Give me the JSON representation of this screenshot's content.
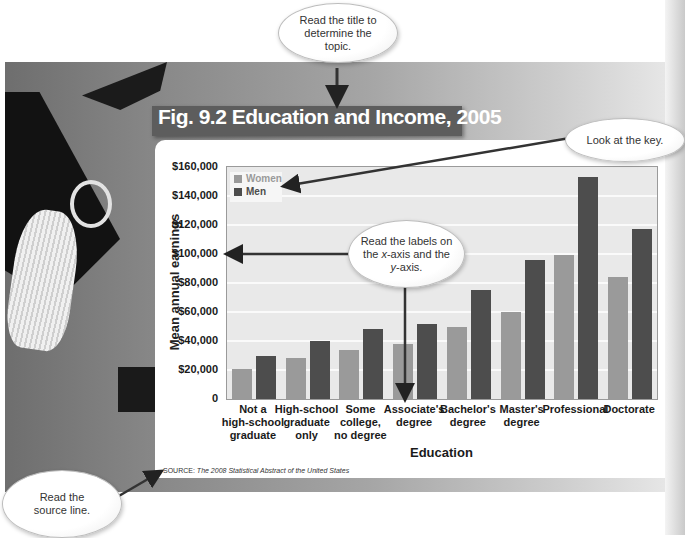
{
  "figure": {
    "title": "Fig. 9.2 Education and Income, 2005",
    "source_prefix": "SOURCE:",
    "source_text": "The 2008 Statistical Abstract of the United States"
  },
  "callouts": {
    "title": "Read the title to determine the topic.",
    "key": "Look at the key.",
    "axes_prefix": "Read the labels on the ",
    "axes_x": "x",
    "axes_mid": "-axis and the ",
    "axes_y": "y",
    "axes_suffix": "-axis.",
    "source": "Read the source line."
  },
  "colors": {
    "women": "#9a9a9a",
    "men": "#4d4d4d",
    "title_bar": "#5d5d5d",
    "plot_bg": "#e9e9e9"
  },
  "chart_data": {
    "type": "bar",
    "title": "Fig. 9.2 Education and Income, 2005",
    "xlabel": "Education",
    "ylabel": "Mean annual earnings",
    "ylim": [
      0,
      160000
    ],
    "yticks": [
      "0",
      "$20,000",
      "$40,000",
      "$60,000",
      "$80,000",
      "$100,000",
      "$120,000",
      "$140,000",
      "$160,000"
    ],
    "ytick_values": [
      0,
      20000,
      40000,
      60000,
      80000,
      100000,
      120000,
      140000,
      160000
    ],
    "grid": true,
    "legend_position": "top-left inside plot",
    "categories": [
      "Not a high-school graduate",
      "High-school graduate only",
      "Some college, no degree",
      "Associate's degree",
      "Bachelor's degree",
      "Master's degree",
      "Professional",
      "Doctorate"
    ],
    "category_lines": [
      [
        "Not a",
        "high-school",
        "graduate"
      ],
      [
        "High-school",
        "graduate",
        "only"
      ],
      [
        "Some",
        "college,",
        "no degree"
      ],
      [
        "Associate's",
        "degree"
      ],
      [
        "Bachelor's",
        "degree"
      ],
      [
        "Master's",
        "degree"
      ],
      [
        "Professional"
      ],
      [
        "Doctorate"
      ]
    ],
    "series": [
      {
        "name": "Women",
        "values": [
          21000,
          28000,
          34000,
          38000,
          50000,
          60000,
          99000,
          84000
        ]
      },
      {
        "name": "Men",
        "values": [
          30000,
          40000,
          48000,
          52000,
          75000,
          96000,
          153000,
          117000
        ]
      }
    ]
  }
}
